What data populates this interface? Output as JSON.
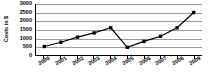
{
  "chart_data": {
    "type": "line",
    "title": "",
    "xlabel": "",
    "ylabel": "Costs in $",
    "categories": [
      "2000",
      "2001",
      "2002",
      "2003",
      "2004",
      "2005",
      "2006",
      "2007",
      "2008",
      "2009"
    ],
    "values": [
      500,
      750,
      1050,
      1300,
      1600,
      450,
      800,
      1100,
      1600,
      2500
    ],
    "series": [
      {
        "name": "Costs",
        "values": [
          500,
          750,
          1050,
          1300,
          1600,
          450,
          800,
          1100,
          1600,
          2500
        ],
        "marker": "square",
        "marker_color": "#000000",
        "line_color": "#000000"
      }
    ],
    "ylim": [
      0,
      3000
    ],
    "yticks": [
      0,
      500,
      1000,
      1500,
      2000,
      2500,
      3000
    ],
    "ytick_labels": [
      "0",
      "500",
      "1000",
      "1500",
      "2000",
      "2500",
      "3000"
    ],
    "grid": true,
    "grid_color": "#9a9a9a",
    "legend": false,
    "legend_position": "none",
    "background_color": "#ffffff",
    "axis_color": "#000000"
  }
}
